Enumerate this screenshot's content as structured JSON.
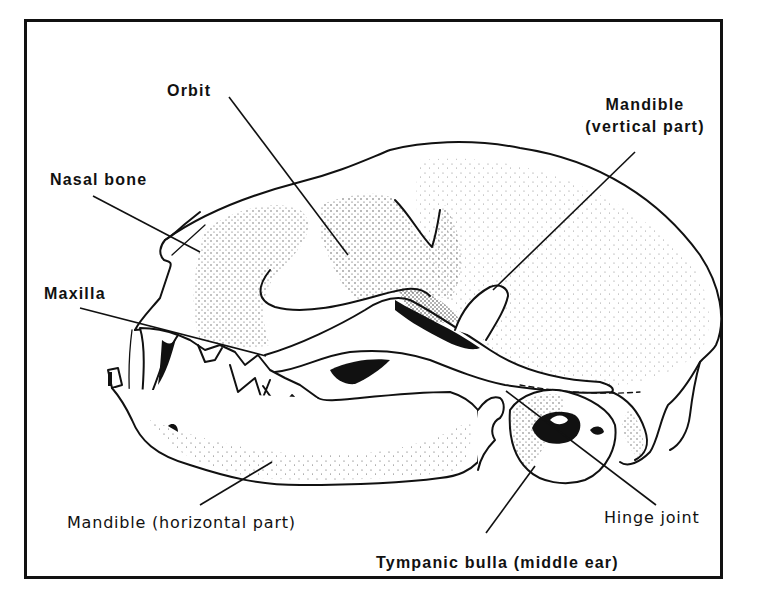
{
  "figure": {
    "colors": {
      "ink": "#111111",
      "paper": "#ffffff"
    }
  },
  "labels": {
    "orbit": "Orbit",
    "mandible_vertical_line1": "Mandible",
    "mandible_vertical_line2": "(vertical part)",
    "nasal_bone": "Nasal bone",
    "maxilla": "Maxilla",
    "mandible_horizontal": "Mandible (horizontal part)",
    "hinge_joint": "Hinge joint",
    "tympanic_bulla": "Tympanic bulla (middle ear)"
  },
  "leaders": [
    {
      "label": "orbit",
      "from": [
        229,
        97
      ],
      "to": [
        348,
        255
      ]
    },
    {
      "label": "mandible_vertical",
      "from": [
        635,
        152
      ],
      "to": [
        493,
        290
      ]
    },
    {
      "label": "nasal_bone",
      "from": [
        93,
        196
      ],
      "to": [
        200,
        252
      ]
    },
    {
      "label": "maxilla",
      "from": [
        80,
        308
      ],
      "to": [
        266,
        356
      ]
    },
    {
      "label": "mandible_horizontal",
      "from": [
        200,
        505
      ],
      "to": [
        272,
        462
      ]
    },
    {
      "label": "hinge_joint",
      "from": [
        656,
        505
      ],
      "to": [
        506,
        391
      ]
    },
    {
      "label": "tympanic_bulla",
      "from": [
        486,
        533
      ],
      "to": [
        535,
        466
      ]
    }
  ]
}
